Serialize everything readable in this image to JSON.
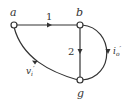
{
  "diagram": {
    "type": "network-graph",
    "nodes": [
      {
        "id": "a",
        "label": "a"
      },
      {
        "id": "b",
        "label": "b"
      },
      {
        "id": "g",
        "label": "g"
      }
    ],
    "edges": [
      {
        "from": "a",
        "to": "b",
        "label": "1"
      },
      {
        "from": "b",
        "to": "g",
        "label": "2"
      },
      {
        "from": "b",
        "to": "g",
        "label": "i",
        "sub": "o",
        "prime": "′"
      },
      {
        "from": "a",
        "to": "g",
        "label": "v",
        "sub": "i",
        "prime": "′"
      }
    ],
    "colors": {
      "line": "#333333",
      "node_fill": "#ffffff"
    }
  }
}
